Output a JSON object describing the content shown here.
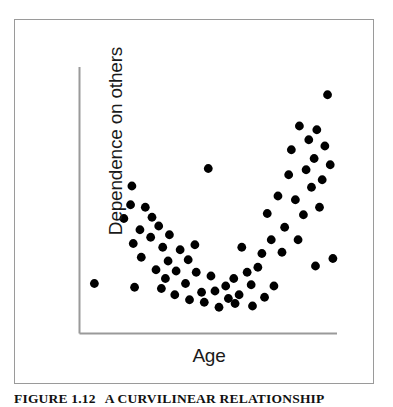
{
  "figure": {
    "caption_number": "FIGURE 1.12",
    "caption_text": "A CURVILINEAR RELATIONSHIP",
    "frame_color": "#9a9a9a",
    "background": "#ffffff"
  },
  "chart_data": {
    "type": "scatter",
    "title": "",
    "subtitle": "",
    "xlabel": "Age",
    "ylabel": "Dependence on others",
    "xticklabels": [],
    "yticklabels": [],
    "grid": false,
    "legend": null,
    "axis_style": "L-shaped spine (left and bottom only), no tick marks, no tick labels",
    "marker": {
      "shape": "circle",
      "color": "#000000",
      "radius_px": 4.4
    },
    "xlim": [
      0,
      100
    ],
    "ylim": [
      0,
      100
    ],
    "annotation": "U-shaped (curvilinear) pattern: dependence is high in youth, falls to a minimum in middle age, and rises again in old age.",
    "n_points": 68,
    "points": [
      {
        "x": 3.5,
        "y": 17.0
      },
      {
        "x": 17.5,
        "y": 56.0
      },
      {
        "x": 17.0,
        "y": 48.5
      },
      {
        "x": 14.5,
        "y": 43.0
      },
      {
        "x": 22.5,
        "y": 47.5
      },
      {
        "x": 20.5,
        "y": 38.5
      },
      {
        "x": 25.0,
        "y": 43.5
      },
      {
        "x": 18.0,
        "y": 33.0
      },
      {
        "x": 24.5,
        "y": 35.5
      },
      {
        "x": 27.5,
        "y": 40.0
      },
      {
        "x": 21.0,
        "y": 27.5
      },
      {
        "x": 29.0,
        "y": 31.5
      },
      {
        "x": 31.5,
        "y": 36.5
      },
      {
        "x": 18.5,
        "y": 15.5
      },
      {
        "x": 26.5,
        "y": 22.5
      },
      {
        "x": 31.0,
        "y": 26.0
      },
      {
        "x": 35.5,
        "y": 30.5
      },
      {
        "x": 34.0,
        "y": 22.0
      },
      {
        "x": 38.5,
        "y": 26.5
      },
      {
        "x": 28.5,
        "y": 15.0
      },
      {
        "x": 33.5,
        "y": 12.5
      },
      {
        "x": 37.5,
        "y": 17.0
      },
      {
        "x": 41.5,
        "y": 21.5
      },
      {
        "x": 39.0,
        "y": 10.5
      },
      {
        "x": 43.5,
        "y": 13.5
      },
      {
        "x": 44.5,
        "y": 9.5
      },
      {
        "x": 47.0,
        "y": 20.0
      },
      {
        "x": 48.5,
        "y": 14.0
      },
      {
        "x": 50.0,
        "y": 7.5
      },
      {
        "x": 52.5,
        "y": 16.0
      },
      {
        "x": 46.0,
        "y": 63.0
      },
      {
        "x": 53.5,
        "y": 11.0
      },
      {
        "x": 55.5,
        "y": 19.0
      },
      {
        "x": 57.5,
        "y": 12.5
      },
      {
        "x": 58.5,
        "y": 31.5
      },
      {
        "x": 60.5,
        "y": 21.5
      },
      {
        "x": 62.0,
        "y": 16.5
      },
      {
        "x": 64.5,
        "y": 23.5
      },
      {
        "x": 66.0,
        "y": 29.0
      },
      {
        "x": 68.0,
        "y": 45.0
      },
      {
        "x": 69.5,
        "y": 34.5
      },
      {
        "x": 70.5,
        "y": 16.0
      },
      {
        "x": 72.0,
        "y": 52.0
      },
      {
        "x": 73.5,
        "y": 29.5
      },
      {
        "x": 74.5,
        "y": 39.5
      },
      {
        "x": 76.0,
        "y": 60.5
      },
      {
        "x": 77.0,
        "y": 70.5
      },
      {
        "x": 78.5,
        "y": 50.5
      },
      {
        "x": 79.5,
        "y": 34.5
      },
      {
        "x": 80.0,
        "y": 80.0
      },
      {
        "x": 81.5,
        "y": 44.5
      },
      {
        "x": 82.5,
        "y": 62.5
      },
      {
        "x": 83.5,
        "y": 74.5
      },
      {
        "x": 84.5,
        "y": 55.5
      },
      {
        "x": 85.5,
        "y": 67.0
      },
      {
        "x": 86.5,
        "y": 78.5
      },
      {
        "x": 87.5,
        "y": 47.5
      },
      {
        "x": 88.5,
        "y": 58.5
      },
      {
        "x": 89.5,
        "y": 72.0
      },
      {
        "x": 90.5,
        "y": 92.5
      },
      {
        "x": 91.5,
        "y": 64.5
      },
      {
        "x": 92.5,
        "y": 27.0
      },
      {
        "x": 86.0,
        "y": 24.0
      },
      {
        "x": 67.0,
        "y": 11.5
      },
      {
        "x": 62.5,
        "y": 8.0
      },
      {
        "x": 56.0,
        "y": 9.0
      },
      {
        "x": 41.0,
        "y": 32.5
      },
      {
        "x": 30.0,
        "y": 19.0
      }
    ]
  }
}
